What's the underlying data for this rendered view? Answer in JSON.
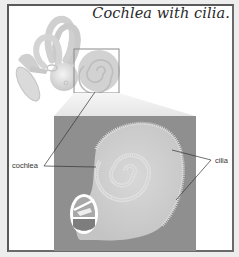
{
  "figure": {
    "title": "Cochlea with cilia.",
    "labels": {
      "cochlea": "cochlea",
      "cilia": "cilia"
    },
    "icons": {
      "inner_ear": "inner-ear-illustration",
      "cochlea_zoom": "cochlea-magnified-illustration",
      "cross_section": "cochlea-cross-section-inset"
    },
    "colors": {
      "page_background": "#ededed",
      "frame_border": "#5a5a5a",
      "zoom_panel_background": "#8f8f8f",
      "cochlea_fill": "#cfcfcf",
      "illustration_gray": "#d4d4d4"
    }
  }
}
